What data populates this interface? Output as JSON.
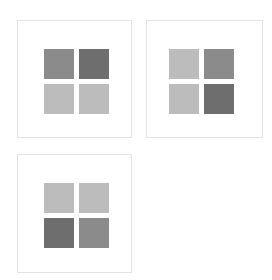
{
  "colors": {
    "light": "#bcbcbc",
    "medium": "#8b8b8b",
    "dark": "#6e6e6e",
    "panel_border": "#e4e4e4",
    "background": "#ffffff"
  },
  "panels": [
    {
      "name": "panel-1",
      "tiles": [
        "medium",
        "dark",
        "light",
        "light"
      ]
    },
    {
      "name": "panel-2",
      "tiles": [
        "light",
        "medium",
        "light",
        "dark"
      ]
    },
    {
      "name": "panel-3",
      "tiles": [
        "light",
        "light",
        "dark",
        "medium"
      ]
    }
  ]
}
